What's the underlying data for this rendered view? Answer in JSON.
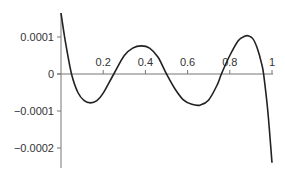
{
  "chart_data": {
    "type": "line",
    "title": "",
    "xlabel": "",
    "ylabel": "",
    "xlim": [
      0,
      1
    ],
    "ylim": [
      -0.00024,
      0.000165
    ],
    "grid": false,
    "legend": null,
    "x_ticks": [
      {
        "value": 0.2,
        "label": "0.2"
      },
      {
        "value": 0.4,
        "label": "0.4"
      },
      {
        "value": 0.6,
        "label": "0.6"
      },
      {
        "value": 0.8,
        "label": "0.8"
      },
      {
        "value": 1.0,
        "label": "1"
      }
    ],
    "y_ticks": [
      {
        "value": 0.0001,
        "label": "0.0001"
      },
      {
        "value": 0,
        "label": "0"
      },
      {
        "value": -0.0001,
        "label": "−0.0001"
      },
      {
        "value": -0.0002,
        "label": "−0.0002"
      }
    ],
    "series": [
      {
        "name": "f(x)",
        "color": "#222222",
        "x": [
          0.0,
          0.02,
          0.05,
          0.08,
          0.11,
          0.14,
          0.17,
          0.2,
          0.25,
          0.3,
          0.34,
          0.38,
          0.42,
          0.46,
          0.5,
          0.54,
          0.58,
          0.62,
          0.66,
          0.7,
          0.74,
          0.76,
          0.8,
          0.84,
          0.87,
          0.89,
          0.91,
          0.93,
          0.95,
          0.96,
          0.98,
          1.0
        ],
        "y": [
          0.000165,
          9e-05,
          0.0,
          -5e-05,
          -7.2e-05,
          -7.8e-05,
          -7.2e-05,
          -5.2e-05,
          0.0,
          5e-05,
          7e-05,
          7.6e-05,
          7e-05,
          4.5e-05,
          0.0,
          -4e-05,
          -7e-05,
          -8.2e-05,
          -8.4e-05,
          -7e-05,
          -3e-05,
          0.0,
          5e-05,
          9e-05,
          0.000102,
          0.000103,
          9.5e-05,
          7e-05,
          3e-05,
          0.0,
          -0.0001,
          -0.00024
        ]
      }
    ],
    "annotations": []
  }
}
